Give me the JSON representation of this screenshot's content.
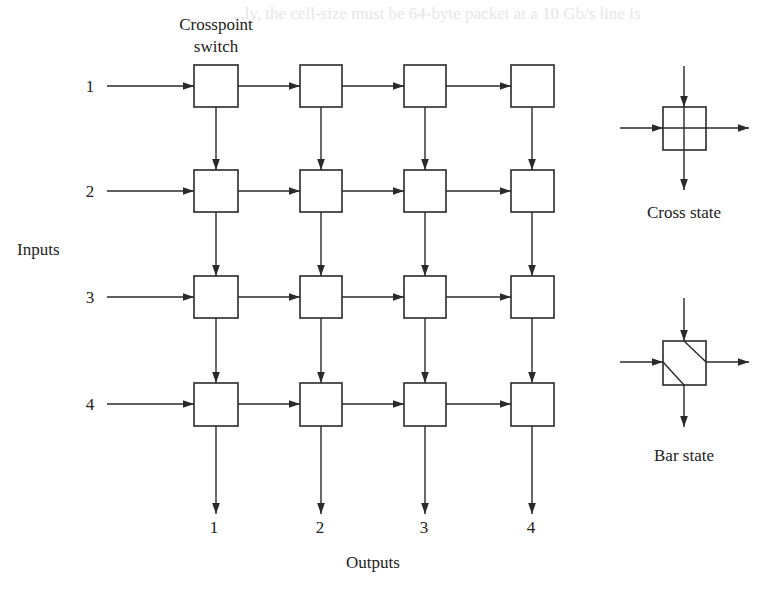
{
  "background_text": "...ly, the cell-size must be 64-byte packet at a 10 Gb/s line is",
  "labels": {
    "crosspoint_line1": "Crosspoint",
    "crosspoint_line2": "switch",
    "inputs": "Inputs",
    "outputs": "Outputs",
    "cross_state": "Cross state",
    "bar_state": "Bar state"
  },
  "inputs": [
    "1",
    "2",
    "3",
    "4"
  ],
  "outputs": [
    "1",
    "2",
    "3",
    "4"
  ],
  "colors": {
    "stroke": "#2a2a2a",
    "text": "#222222",
    "background": "#ffffff"
  },
  "grid": {
    "rows": 4,
    "cols": 4
  }
}
